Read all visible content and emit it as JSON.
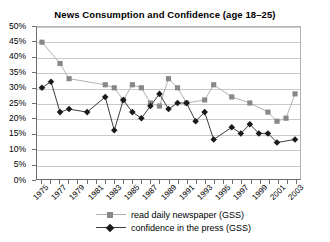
{
  "chart_data": {
    "type": "line",
    "title": "News Consumption and Confidence (age 18–25)",
    "xlabel": "",
    "ylabel": "",
    "ylim": [
      0,
      50
    ],
    "xlim": [
      1975,
      2003
    ],
    "grid": true,
    "legend_position": "bottom",
    "y_tick_labels": [
      "50%",
      "45%",
      "40%",
      "35%",
      "30%",
      "25%",
      "20%",
      "15%",
      "10%",
      "5%",
      "0%"
    ],
    "y_tick_values": [
      50,
      45,
      40,
      35,
      30,
      25,
      20,
      15,
      10,
      5,
      0
    ],
    "x": [
      1975,
      1976,
      1977,
      1978,
      1979,
      1980,
      1981,
      1982,
      1983,
      1984,
      1985,
      1986,
      1987,
      1988,
      1989,
      1990,
      1991,
      1992,
      1993,
      1994,
      1995,
      1996,
      1997,
      1998,
      1999,
      2000,
      2001,
      2002,
      2003
    ],
    "x_tick_labels": [
      "1975",
      "1977",
      "1979",
      "1981",
      "1983",
      "1985",
      "1987",
      "1989",
      "1991",
      "1993",
      "1995",
      "1997",
      "1999",
      "2001",
      "2003"
    ],
    "x_tick_label_years": [
      1975,
      1977,
      1979,
      1981,
      1983,
      1985,
      1987,
      1989,
      1991,
      1993,
      1995,
      1997,
      1999,
      2001,
      2003
    ],
    "series": [
      {
        "name": "read daily newspaper (GSS)",
        "marker": "square",
        "color": "#888888",
        "line_color": "#b0b0b0",
        "points": [
          {
            "x": 1975,
            "y": 45
          },
          {
            "x": 1977,
            "y": 38
          },
          {
            "x": 1978,
            "y": 33
          },
          {
            "x": 1982,
            "y": 31
          },
          {
            "x": 1983,
            "y": 30
          },
          {
            "x": 1984,
            "y": 26
          },
          {
            "x": 1985,
            "y": 31
          },
          {
            "x": 1986,
            "y": 30
          },
          {
            "x": 1987,
            "y": 25
          },
          {
            "x": 1988,
            "y": 24
          },
          {
            "x": 1989,
            "y": 33
          },
          {
            "x": 1990,
            "y": 30
          },
          {
            "x": 1991,
            "y": 25
          },
          {
            "x": 1993,
            "y": 26
          },
          {
            "x": 1994,
            "y": 31
          },
          {
            "x": 1996,
            "y": 27
          },
          {
            "x": 1998,
            "y": 25
          },
          {
            "x": 2000,
            "y": 22
          },
          {
            "x": 2001,
            "y": 19
          },
          {
            "x": 2002,
            "y": 20
          },
          {
            "x": 2003,
            "y": 28
          }
        ]
      },
      {
        "name": "confidence in the press (GSS)",
        "marker": "diamond",
        "color": "#1a1a1a",
        "line_color": "#3a3a3a",
        "points": [
          {
            "x": 1975,
            "y": 30
          },
          {
            "x": 1976,
            "y": 32
          },
          {
            "x": 1977,
            "y": 22
          },
          {
            "x": 1978,
            "y": 23
          },
          {
            "x": 1980,
            "y": 22
          },
          {
            "x": 1982,
            "y": 27
          },
          {
            "x": 1983,
            "y": 16
          },
          {
            "x": 1984,
            "y": 26
          },
          {
            "x": 1985,
            "y": 22
          },
          {
            "x": 1986,
            "y": 20
          },
          {
            "x": 1987,
            "y": 24
          },
          {
            "x": 1988,
            "y": 28
          },
          {
            "x": 1989,
            "y": 23
          },
          {
            "x": 1990,
            "y": 25
          },
          {
            "x": 1991,
            "y": 25
          },
          {
            "x": 1992,
            "y": 19
          },
          {
            "x": 1993,
            "y": 22
          },
          {
            "x": 1994,
            "y": 13
          },
          {
            "x": 1996,
            "y": 17
          },
          {
            "x": 1997,
            "y": 15
          },
          {
            "x": 1998,
            "y": 18
          },
          {
            "x": 1999,
            "y": 15
          },
          {
            "x": 2000,
            "y": 15
          },
          {
            "x": 2001,
            "y": 12
          },
          {
            "x": 2003,
            "y": 13
          }
        ]
      }
    ]
  }
}
